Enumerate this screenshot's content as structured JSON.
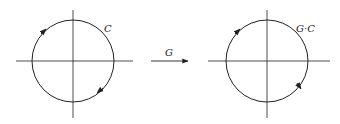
{
  "left_panel": {
    "curve_label": "C",
    "center": [
      73,
      61
    ],
    "radius": 41
  },
  "transform": {
    "label": "G"
  },
  "right_panel": {
    "curve_label": "G·C",
    "center": [
      267,
      61
    ],
    "radius": 41
  },
  "colors": {
    "stroke": "#222222",
    "background": "#ffffff"
  }
}
